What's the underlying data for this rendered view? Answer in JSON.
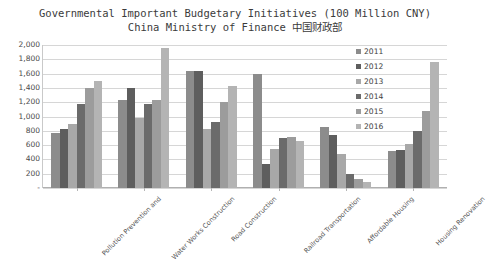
{
  "chart_data": {
    "type": "bar",
    "title": "Governmental Important Budgetary Initiatives (100 Million CNY)",
    "subtitle": "China Ministry of Finance 中国财政部",
    "xlabel": "",
    "ylabel": "",
    "ylim": [
      0,
      2000
    ],
    "ytick_labels": [
      "2,000",
      "1,800",
      "1,600",
      "1,400",
      "1,200",
      "1,000",
      "800",
      "600",
      "400",
      "200",
      "-"
    ],
    "ytick_values": [
      2000,
      1800,
      1600,
      1400,
      1200,
      1000,
      800,
      600,
      400,
      200,
      0
    ],
    "grid": true,
    "legend_position": "right-inside-top",
    "categories": [
      "Pollution Prevention and",
      "Water Works Construction",
      "Road Construction",
      "Railroad Transportation",
      "Affordable Housing",
      "Housing Renovation"
    ],
    "series": [
      {
        "name": "2011",
        "color": "#8c8c8c",
        "values": [
          770,
          1230,
          1630,
          1600,
          860,
          520
        ]
      },
      {
        "name": "2012",
        "color": "#5e5e5e",
        "values": [
          830,
          1400,
          1630,
          330,
          740,
          530
        ]
      },
      {
        "name": "2013",
        "color": "#a8a8a8",
        "values": [
          900,
          980,
          830,
          550,
          480,
          620
        ]
      },
      {
        "name": "2014",
        "color": "#6b6b6b",
        "values": [
          1180,
          1180,
          930,
          700,
          200,
          800
        ]
      },
      {
        "name": "2015",
        "color": "#9c9c9c",
        "values": [
          1400,
          1230,
          1200,
          720,
          130,
          1080
        ]
      },
      {
        "name": "2016",
        "color": "#b4b4b4",
        "values": [
          1500,
          1960,
          1420,
          660,
          90,
          1760
        ]
      }
    ]
  },
  "colors": {
    "gridline": "#d6d6d6",
    "axis": "#b0b0b0",
    "text": "#404040",
    "background": "#ffffff"
  }
}
